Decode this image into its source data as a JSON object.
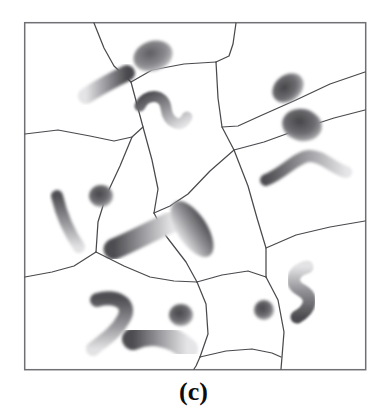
{
  "figure": {
    "caption": "(c)",
    "panel_label": "c",
    "frame": {
      "x": 24,
      "y": 22,
      "width": 342,
      "height": 348,
      "stroke_color": "#6f7073",
      "stroke_width": 1.4,
      "fill_color": "#ffffff"
    },
    "style": {
      "background_color": "#ffffff",
      "boundary_color": "#4a4a4e",
      "boundary_width": 1.2,
      "particle_dark": "#4e4e52",
      "particle_mid": "#8e8e92",
      "particle_light": "#d8d8da",
      "caption_color": "#0d0d0d"
    },
    "grain_boundaries": [
      {
        "name": "gb-top-left-spur",
        "points": "94,22 110,62 131,82"
      },
      {
        "name": "gb-top-mid-spur",
        "points": "131,82 151,69 186,64 216,62"
      },
      {
        "name": "gb-top-right-spur",
        "points": "236,22 233,50 229,62 216,62"
      },
      {
        "name": "gb-left-upper-edge",
        "points": "24,134 60,131 92,136 114,140 131,137 142,128 131,82"
      },
      {
        "name": "gb-mid-upper-right",
        "points": "216,62 217,100 222,127 234,150"
      },
      {
        "name": "gb-upper-right-long",
        "points": "234,150 262,143 300,130 334,119 366,110"
      },
      {
        "name": "gb-right-diag-upper",
        "points": "366,72 330,84 296,100 262,116 238,127 222,127"
      },
      {
        "name": "gb-mid-center-left",
        "points": "142,128 152,161 158,190 154,213"
      },
      {
        "name": "gb-center-down",
        "points": "154,213 166,236 186,262 197,282"
      },
      {
        "name": "gb-mid-horizontal",
        "points": "234,150 210,172 186,196 170,206 154,213"
      },
      {
        "name": "gb-left-mid-down",
        "points": "131,137 120,166 106,196 98,222 96,252"
      },
      {
        "name": "gb-left-lower-edge",
        "points": "24,277 52,272 74,266 96,252"
      },
      {
        "name": "gb-left-lower-down",
        "points": "96,252 124,266 150,277 174,281 197,282"
      },
      {
        "name": "gb-center-lower-down",
        "points": "197,282 206,304 208,334 200,358 194,370"
      },
      {
        "name": "gb-center-right-down",
        "points": "197,282 222,275 248,272 266,277"
      },
      {
        "name": "gb-right-mid-vertex",
        "points": "234,150 248,186 256,218 266,248 266,277"
      },
      {
        "name": "gb-right-edge-out",
        "points": "266,248 296,235 330,227 366,221"
      },
      {
        "name": "gb-right-lower-down",
        "points": "266,277 278,300 284,332 282,358 280,370"
      },
      {
        "name": "gb-bottom-mid-join",
        "points": "200,358 226,352 252,350 272,354 280,358"
      }
    ],
    "particles": [
      {
        "name": "particle-top-blob",
        "shape": "blob",
        "cx": 152,
        "cy": 55,
        "rx": 20,
        "ry": 14,
        "rot": -20,
        "dark_at": "bottom-left",
        "intensity": 0.55
      },
      {
        "name": "particle-upper-left-rod",
        "shape": "rod",
        "path": "M 88,95 C 100,86 116,79 126,74",
        "width": 15,
        "dark_at": "end",
        "intensity": 0.62
      },
      {
        "name": "particle-wavy-top",
        "shape": "wave",
        "path": "M 140,104 C 152,92 168,98 167,112 C 166,126 180,132 186,120",
        "width": 11,
        "dark_at": "start",
        "intensity": 0.68
      },
      {
        "name": "particle-top-right-blob",
        "shape": "blob",
        "cx": 288,
        "cy": 88,
        "rx": 17,
        "ry": 13,
        "rot": -35,
        "dark_at": "center",
        "intensity": 0.75
      },
      {
        "name": "particle-right-blob",
        "shape": "blob",
        "cx": 302,
        "cy": 124,
        "rx": 19,
        "ry": 16,
        "rot": 10,
        "dark_at": "center",
        "intensity": 0.8
      },
      {
        "name": "particle-right-chevron",
        "shape": "wave",
        "path": "M 267,178 C 282,172 296,158 308,156 C 320,155 330,166 344,170",
        "width": 12,
        "dark_at": "middle",
        "intensity": 0.62
      },
      {
        "name": "particle-left-rod",
        "shape": "rod",
        "path": "M 58,196 C 62,212 68,230 78,246",
        "width": 12,
        "dark_at": "end",
        "intensity": 0.58
      },
      {
        "name": "particle-small-round",
        "shape": "blob",
        "cx": 101,
        "cy": 196,
        "rx": 11,
        "ry": 10,
        "rot": 0,
        "dark_at": "center",
        "intensity": 0.62
      },
      {
        "name": "particle-center-lozenge",
        "shape": "rod",
        "path": "M 112,248 C 132,240 156,228 172,222",
        "width": 20,
        "dark_at": "start",
        "intensity": 0.6
      },
      {
        "name": "particle-center-ellipse",
        "shape": "blob",
        "cx": 192,
        "cy": 228,
        "rx": 30,
        "ry": 14,
        "rot": 55,
        "dark_at": "top",
        "intensity": 0.7
      },
      {
        "name": "particle-lower-left-hook",
        "shape": "wave",
        "path": "M 98,300 C 116,296 130,304 124,318 C 118,332 104,340 94,348",
        "width": 13,
        "dark_at": "middle",
        "intensity": 0.66
      },
      {
        "name": "particle-bottom-banana",
        "shape": "rod",
        "path": "M 134,338 C 152,332 172,336 186,348",
        "width": 21,
        "dark_at": "end",
        "intensity": 0.74
      },
      {
        "name": "particle-bottom-round",
        "shape": "blob",
        "cx": 181,
        "cy": 314,
        "rx": 11,
        "ry": 10,
        "rot": 0,
        "dark_at": "center",
        "intensity": 0.68
      },
      {
        "name": "particle-right-small-dot",
        "shape": "blob",
        "cx": 264,
        "cy": 310,
        "rx": 9,
        "ry": 9,
        "rot": 0,
        "dark_at": "center",
        "intensity": 0.66
      },
      {
        "name": "particle-right-squiggle",
        "shape": "wave",
        "path": "M 306,268 C 292,272 290,284 302,290 C 314,296 312,308 298,316",
        "width": 13,
        "dark_at": "bottom",
        "intensity": 0.7
      }
    ]
  }
}
